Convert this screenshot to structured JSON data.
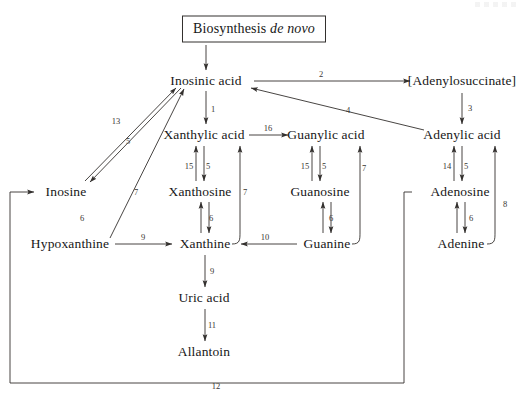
{
  "diagram": {
    "line_color": "#33302e",
    "text_color": "#171717",
    "nodes": [
      {
        "id": "biosynthesis",
        "label_main": "Biosynthesis",
        "label_italic": "de novo",
        "x": 254,
        "y": 29,
        "boxed": true
      },
      {
        "id": "inosinic_acid",
        "label": "Inosinic acid",
        "x": 206,
        "y": 81
      },
      {
        "id": "adenylosuccinate",
        "label": "[Adenylosuccinate]",
        "x": 462,
        "y": 81
      },
      {
        "id": "xanthylic_acid",
        "label": "Xanthylic acid",
        "x": 204,
        "y": 135
      },
      {
        "id": "guanylic_acid",
        "label": "Guanylic acid",
        "x": 326,
        "y": 135
      },
      {
        "id": "adenylic_acid",
        "label": "Adenylic acid",
        "x": 462,
        "y": 135
      },
      {
        "id": "inosine",
        "label": "Inosine",
        "x": 66,
        "y": 192
      },
      {
        "id": "xanthosine",
        "label": "Xanthosine",
        "x": 200,
        "y": 192
      },
      {
        "id": "guanosine",
        "label": "Guanosine",
        "x": 320,
        "y": 192
      },
      {
        "id": "adenosine",
        "label": "Adenosine",
        "x": 460,
        "y": 192
      },
      {
        "id": "hypoxanthine",
        "label": "Hypoxanthine",
        "x": 70,
        "y": 244
      },
      {
        "id": "xanthine",
        "label": "Xanthine",
        "x": 205,
        "y": 244
      },
      {
        "id": "guanine",
        "label": "Guanine",
        "x": 327,
        "y": 244
      },
      {
        "id": "adenine",
        "label": "Adenine",
        "x": 461,
        "y": 244
      },
      {
        "id": "uric_acid",
        "label": "Uric acid",
        "x": 204,
        "y": 298
      },
      {
        "id": "allantoin",
        "label": "Allantoin",
        "x": 204,
        "y": 352
      }
    ],
    "steps": [
      {
        "n": "2",
        "x": 321,
        "y": 74,
        "from": "inosinic_acid",
        "to": "adenylosuccinate"
      },
      {
        "n": "3",
        "x": 470,
        "y": 108,
        "from": "adenylosuccinate",
        "to": "adenylic_acid"
      },
      {
        "n": "1",
        "x": 213,
        "y": 109,
        "from": "inosinic_acid",
        "to": "xanthylic_acid"
      },
      {
        "n": "4",
        "x": 348,
        "y": 110,
        "from": "adenylic_acid",
        "to": "inosinic_acid"
      },
      {
        "n": "13",
        "x": 116,
        "y": 121,
        "from": "inosine",
        "to": "inosinic_acid"
      },
      {
        "n": "5",
        "x": 128,
        "y": 141,
        "from": "inosinic_acid",
        "to": "inosine"
      },
      {
        "n": "16",
        "x": 268,
        "y": 128,
        "from": "xanthylic_acid",
        "to": "guanylic_acid"
      },
      {
        "n": "15",
        "x": 189,
        "y": 166,
        "from": "xanthosine",
        "to": "xanthylic_acid"
      },
      {
        "n": "5",
        "x": 208,
        "y": 166,
        "from": "xanthylic_acid",
        "to": "xanthosine"
      },
      {
        "n": "15",
        "x": 305,
        "y": 166,
        "from": "guanosine",
        "to": "guanylic_acid"
      },
      {
        "n": "5",
        "x": 324,
        "y": 166,
        "from": "guanylic_acid",
        "to": "guanosine"
      },
      {
        "n": "14",
        "x": 447,
        "y": 166,
        "from": "adenosine",
        "to": "adenylic_acid"
      },
      {
        "n": "5",
        "x": 466,
        "y": 166,
        "from": "adenylic_acid",
        "to": "adenosine"
      },
      {
        "n": "7",
        "x": 136,
        "y": 192,
        "from": "hypoxanthine",
        "to": "inosinic_acid"
      },
      {
        "n": "7",
        "x": 245,
        "y": 192,
        "from": "xanthine",
        "to": "xanthylic_acid"
      },
      {
        "n": "7",
        "x": 364,
        "y": 168,
        "from": "guanine",
        "to": "guanylic_acid"
      },
      {
        "n": "8",
        "x": 505,
        "y": 204,
        "from": "adenine",
        "to": "adenylic_acid"
      },
      {
        "n": "6",
        "x": 82,
        "y": 218,
        "from": "hypoxanthine",
        "to": "inosine"
      },
      {
        "n": "6",
        "x": 211,
        "y": 218,
        "from": "xanthine",
        "to": "xanthosine"
      },
      {
        "n": "6",
        "x": 331,
        "y": 218,
        "from": "guanine",
        "to": "guanosine"
      },
      {
        "n": "6",
        "x": 471,
        "y": 218,
        "from": "adenine",
        "to": "adenosine"
      },
      {
        "n": "9",
        "x": 143,
        "y": 237,
        "from": "hypoxanthine",
        "to": "xanthine"
      },
      {
        "n": "10",
        "x": 265,
        "y": 237,
        "from": "guanine",
        "to": "xanthine"
      },
      {
        "n": "9",
        "x": 212,
        "y": 271,
        "from": "xanthine",
        "to": "uric_acid"
      },
      {
        "n": "11",
        "x": 212,
        "y": 325,
        "from": "uric_acid",
        "to": "allantoin"
      },
      {
        "n": "12",
        "x": 216,
        "y": 386,
        "from": "adenosine",
        "to": "inosine"
      }
    ]
  }
}
